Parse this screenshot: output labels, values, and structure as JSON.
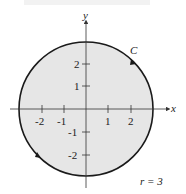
{
  "figure": {
    "curve_label": "C",
    "radius_label": "r = 3",
    "axes": {
      "x_label": "x",
      "y_label": "y"
    },
    "x_ticks": [
      "-2",
      "-1",
      "1",
      "2"
    ],
    "y_ticks": [
      "2",
      "1",
      "-1",
      "-2"
    ],
    "colors": {
      "fill": "#e6e6e6",
      "stroke": "#1a1a1a",
      "axis": "#333333"
    }
  }
}
